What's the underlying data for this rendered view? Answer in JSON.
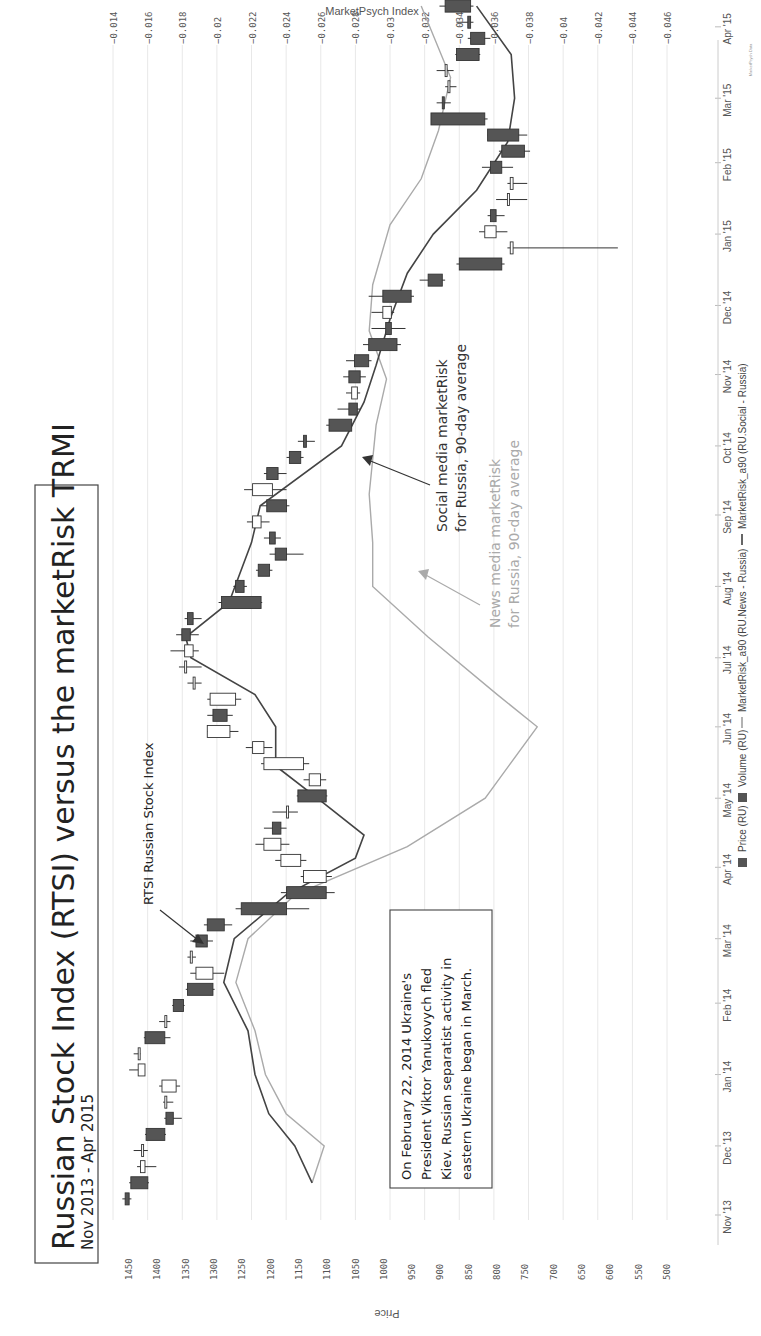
{
  "title": "Russian Stock Index (RTSI) versus the marketRisk TRMI",
  "subtitle": "Nov 2013 - Apr 2015",
  "right_axis_title": "MarketPsych Index",
  "left_axis_title": "Price",
  "watermark": "MarketPsych Data",
  "annotations": {
    "rtsi_label": "RTSI Russian Stock Index",
    "social_label_1": "Social media marketRisk",
    "social_label_2": "for Russia, 90-day average",
    "news_label_1": "News media marketRisk",
    "news_label_2": "for Russia, 90-day average",
    "event_box": [
      "On February 22, 2014 Ukraine's",
      "President Viktor Yanukovych fled",
      "Kiev.  Russian separatist activity in",
      "eastern Ukraine began in March."
    ]
  },
  "legend": {
    "price": "Price (RU)",
    "volume": "Volume (RU)",
    "news": "MarketRisk_a90 (RU.News - Russia)",
    "social": "MarketRisk_a90 (RU.Social - Russia)"
  },
  "colors": {
    "candle_down": "#555555",
    "candle_up": "#ffffff",
    "social_line": "#444444",
    "news_line": "#aaaaaa",
    "grid": "#e6e6e6"
  },
  "chart_data": {
    "type": "candlestick+line",
    "title": "Russian Stock Index (RTSI) versus the marketRisk TRMI",
    "subtitle": "Nov 2013 - Apr 2015",
    "orientation": "rotated 90° (time runs bottom-to-top, price axis along bottom)",
    "xlabel": "Date",
    "ylabel_left": "Price",
    "ylabel_right": "MarketPsych Index",
    "price_ticks": [
      1450,
      1400,
      1350,
      1300,
      1250,
      1200,
      1150,
      1100,
      1050,
      1000,
      950,
      900,
      850,
      800,
      750,
      700,
      650,
      600,
      550,
      500
    ],
    "price_range": [
      500,
      1450
    ],
    "index_ticks": [
      "-0.014",
      "-0.016",
      "-0.018",
      "-0.02",
      "-0.022",
      "-0.024",
      "-0.026",
      "-0.028",
      "-0.03",
      "-0.032",
      "-0.034",
      "-0.036",
      "-0.038",
      "-0.04",
      "-0.042",
      "-0.044",
      "-0.046"
    ],
    "index_range": [
      -0.046,
      -0.014
    ],
    "date_ticks": [
      "Nov '13",
      "Dec '13",
      "Jan '14",
      "Feb '14",
      "Mar '14",
      "Apr '14",
      "May '14",
      "Jun '14",
      "Jul '14",
      "Aug '14",
      "Sep '14",
      "Oct '14",
      "Nov '14",
      "Dec '14",
      "Jan '15",
      "Feb '15",
      "Mar '15",
      "Apr '15"
    ],
    "grid": true,
    "legend_position": "bottom",
    "series": [
      {
        "name": "Price (RU)",
        "type": "candlestick",
        "weekly_candles": [
          {
            "week": "2013-11-08",
            "o": 1455,
            "c": 1448,
            "h": 1460,
            "l": 1444
          },
          {
            "week": "2013-11-15",
            "o": 1445,
            "c": 1415,
            "h": 1448,
            "l": 1413
          },
          {
            "week": "2013-11-22",
            "o": 1420,
            "c": 1428,
            "h": 1434,
            "l": 1400
          },
          {
            "week": "2013-11-29",
            "o": 1426,
            "c": 1426,
            "h": 1440,
            "l": 1415
          },
          {
            "week": "2013-12-06",
            "o": 1418,
            "c": 1385,
            "h": 1420,
            "l": 1383
          },
          {
            "week": "2013-12-13",
            "o": 1383,
            "c": 1370,
            "h": 1386,
            "l": 1355
          },
          {
            "week": "2013-12-20",
            "o": 1385,
            "c": 1385,
            "h": 1388,
            "l": 1370
          },
          {
            "week": "2013-12-27",
            "o": 1365,
            "c": 1390,
            "h": 1395,
            "l": 1358
          },
          {
            "week": "2014-01-03",
            "o": 1420,
            "c": 1432,
            "h": 1448,
            "l": 1420
          },
          {
            "week": "2014-01-10",
            "o": 1432,
            "c": 1432,
            "h": 1440,
            "l": 1428
          },
          {
            "week": "2014-01-17",
            "o": 1420,
            "c": 1385,
            "h": 1422,
            "l": 1375
          },
          {
            "week": "2014-01-24",
            "o": 1385,
            "c": 1385,
            "h": 1395,
            "l": 1375
          },
          {
            "week": "2014-01-31",
            "o": 1370,
            "c": 1352,
            "h": 1372,
            "l": 1350
          },
          {
            "week": "2014-02-07",
            "o": 1345,
            "c": 1300,
            "h": 1348,
            "l": 1297
          },
          {
            "week": "2014-02-14",
            "o": 1300,
            "c": 1330,
            "h": 1340,
            "l": 1280
          },
          {
            "week": "2014-02-21",
            "o": 1340,
            "c": 1340,
            "h": 1345,
            "l": 1330
          },
          {
            "week": "2014-02-28",
            "o": 1330,
            "c": 1310,
            "h": 1340,
            "l": 1300
          },
          {
            "week": "2014-03-07",
            "o": 1310,
            "c": 1280,
            "h": 1316,
            "l": 1266
          },
          {
            "week": "2014-03-14",
            "o": 1250,
            "c": 1170,
            "h": 1260,
            "l": 1130
          },
          {
            "week": "2014-03-21",
            "o": 1170,
            "c": 1100,
            "h": 1180,
            "l": 1085
          },
          {
            "week": "2014-03-28",
            "o": 1100,
            "c": 1140,
            "h": 1145,
            "l": 1090
          },
          {
            "week": "2014-04-04",
            "o": 1145,
            "c": 1180,
            "h": 1190,
            "l": 1135
          },
          {
            "week": "2014-04-11",
            "o": 1180,
            "c": 1210,
            "h": 1225,
            "l": 1165
          },
          {
            "week": "2014-04-18",
            "o": 1195,
            "c": 1180,
            "h": 1210,
            "l": 1170
          },
          {
            "week": "2014-04-25",
            "o": 1170,
            "c": 1170,
            "h": 1195,
            "l": 1150
          },
          {
            "week": "2014-05-02",
            "o": 1150,
            "c": 1100,
            "h": 1152,
            "l": 1098
          },
          {
            "week": "2014-05-09",
            "o": 1110,
            "c": 1130,
            "h": 1140,
            "l": 1100
          },
          {
            "week": "2014-05-16",
            "o": 1140,
            "c": 1210,
            "h": 1215,
            "l": 1130
          },
          {
            "week": "2014-05-23",
            "o": 1210,
            "c": 1230,
            "h": 1242,
            "l": 1195
          },
          {
            "week": "2014-05-30",
            "o": 1270,
            "c": 1310,
            "h": 1310,
            "l": 1255
          },
          {
            "week": "2014-06-06",
            "o": 1300,
            "c": 1275,
            "h": 1310,
            "l": 1265
          },
          {
            "week": "2014-06-13",
            "o": 1260,
            "c": 1305,
            "h": 1310,
            "l": 1250
          },
          {
            "week": "2014-06-20",
            "o": 1335,
            "c": 1335,
            "h": 1345,
            "l": 1320
          },
          {
            "week": "2014-06-27",
            "o": 1350,
            "c": 1350,
            "h": 1360,
            "l": 1320
          },
          {
            "week": "2014-07-04",
            "o": 1335,
            "c": 1350,
            "h": 1375,
            "l": 1325
          },
          {
            "week": "2014-07-11",
            "o": 1355,
            "c": 1340,
            "h": 1365,
            "l": 1325
          },
          {
            "week": "2014-07-18",
            "o": 1345,
            "c": 1335,
            "h": 1350,
            "l": 1320
          },
          {
            "week": "2014-07-25",
            "o": 1285,
            "c": 1215,
            "h": 1290,
            "l": 1213
          },
          {
            "week": "2014-08-01",
            "o": 1260,
            "c": 1245,
            "h": 1264,
            "l": 1240
          },
          {
            "week": "2014-08-08",
            "o": 1220,
            "c": 1200,
            "h": 1224,
            "l": 1195
          },
          {
            "week": "2014-08-15",
            "o": 1190,
            "c": 1170,
            "h": 1200,
            "l": 1140
          },
          {
            "week": "2014-08-22",
            "o": 1200,
            "c": 1190,
            "h": 1210,
            "l": 1180
          },
          {
            "week": "2014-08-29",
            "o": 1215,
            "c": 1230,
            "h": 1240,
            "l": 1200
          },
          {
            "week": "2014-09-05",
            "o": 1205,
            "c": 1170,
            "h": 1215,
            "l": 1165
          },
          {
            "week": "2014-09-12",
            "o": 1195,
            "c": 1230,
            "h": 1245,
            "l": 1170
          },
          {
            "week": "2014-09-19",
            "o": 1205,
            "c": 1185,
            "h": 1210,
            "l": 1170
          },
          {
            "week": "2014-09-26",
            "o": 1165,
            "c": 1145,
            "h": 1170,
            "l": 1140
          },
          {
            "week": "2014-10-03",
            "o": 1140,
            "c": 1135,
            "h": 1150,
            "l": 1120
          },
          {
            "week": "2014-10-10",
            "o": 1095,
            "c": 1055,
            "h": 1100,
            "l": 1054
          },
          {
            "week": "2014-10-17",
            "o": 1060,
            "c": 1045,
            "h": 1080,
            "l": 1040
          },
          {
            "week": "2014-10-24",
            "o": 1045,
            "c": 1055,
            "h": 1065,
            "l": 1040
          },
          {
            "week": "2014-10-31",
            "o": 1060,
            "c": 1040,
            "h": 1070,
            "l": 1030
          },
          {
            "week": "2014-11-07",
            "o": 1050,
            "c": 1025,
            "h": 1065,
            "l": 1020
          },
          {
            "week": "2014-11-14",
            "o": 1025,
            "c": 975,
            "h": 1035,
            "l": 968
          },
          {
            "week": "2014-11-21",
            "o": 995,
            "c": 985,
            "h": 1020,
            "l": 960
          },
          {
            "week": "2014-11-28",
            "o": 985,
            "c": 1000,
            "h": 1020,
            "l": 980
          },
          {
            "week": "2014-12-05",
            "o": 1000,
            "c": 950,
            "h": 1025,
            "l": 945
          },
          {
            "week": "2014-12-12",
            "o": 920,
            "c": 895,
            "h": 935,
            "l": 890
          },
          {
            "week": "2014-12-19",
            "o": 865,
            "c": 790,
            "h": 870,
            "l": 785
          },
          {
            "week": "2014-12-26",
            "o": 770,
            "c": 775,
            "h": 780,
            "l": 585
          },
          {
            "week": "2015-01-02",
            "o": 800,
            "c": 820,
            "h": 830,
            "l": 780
          },
          {
            "week": "2015-01-09",
            "o": 810,
            "c": 800,
            "h": 815,
            "l": 785
          },
          {
            "week": "2015-01-16",
            "o": 780,
            "c": 780,
            "h": 800,
            "l": 745
          },
          {
            "week": "2015-01-23",
            "o": 770,
            "c": 775,
            "h": 780,
            "l": 745
          },
          {
            "week": "2015-01-30",
            "o": 810,
            "c": 790,
            "h": 825,
            "l": 770
          },
          {
            "week": "2015-02-06",
            "o": 790,
            "c": 750,
            "h": 795,
            "l": 740
          },
          {
            "week": "2015-02-13",
            "o": 815,
            "c": 760,
            "h": 815,
            "l": 745
          },
          {
            "week": "2015-02-20",
            "o": 915,
            "c": 820,
            "h": 915,
            "l": 815
          },
          {
            "week": "2015-02-27",
            "o": 895,
            "c": 892,
            "h": 905,
            "l": 880
          },
          {
            "week": "2015-03-06",
            "o": 885,
            "c": 885,
            "h": 890,
            "l": 870
          },
          {
            "week": "2015-03-13",
            "o": 890,
            "c": 890,
            "h": 905,
            "l": 875
          },
          {
            "week": "2015-03-20",
            "o": 870,
            "c": 830,
            "h": 872,
            "l": 828
          },
          {
            "week": "2015-03-27",
            "o": 845,
            "c": 820,
            "h": 850,
            "l": 810
          },
          {
            "week": "2015-04-03",
            "o": 850,
            "c": 845,
            "h": 870,
            "l": 840
          },
          {
            "week": "2015-04-10",
            "o": 890,
            "c": 845,
            "h": 900,
            "l": 840
          }
        ]
      },
      {
        "name": "MarketRisk_a90 (RU.Social - Russia)",
        "type": "line",
        "points_date_index": [
          [
            "2013-11-15",
            -0.0255
          ],
          [
            "2013-12-01",
            -0.0245
          ],
          [
            "2013-12-15",
            -0.023
          ],
          [
            "2014-01-01",
            -0.0222
          ],
          [
            "2014-01-20",
            -0.0218
          ],
          [
            "2014-02-10",
            -0.0204
          ],
          [
            "2014-03-01",
            -0.021
          ],
          [
            "2014-03-20",
            -0.024
          ],
          [
            "2014-04-05",
            -0.028
          ],
          [
            "2014-04-15",
            -0.0285
          ],
          [
            "2014-05-01",
            -0.0258
          ],
          [
            "2014-05-15",
            -0.0234
          ],
          [
            "2014-06-01",
            -0.0234
          ],
          [
            "2014-06-15",
            -0.0222
          ],
          [
            "2014-07-01",
            -0.0185
          ],
          [
            "2014-07-10",
            -0.0182
          ],
          [
            "2014-07-25",
            -0.0207
          ],
          [
            "2014-08-20",
            -0.022
          ],
          [
            "2014-09-05",
            -0.0225
          ],
          [
            "2014-10-01",
            -0.0272
          ],
          [
            "2014-10-20",
            -0.0285
          ],
          [
            "2014-11-05",
            -0.0292
          ],
          [
            "2014-11-25",
            -0.03
          ],
          [
            "2014-12-15",
            -0.031
          ],
          [
            "2015-01-01",
            -0.0325
          ],
          [
            "2015-01-20",
            -0.035
          ],
          [
            "2015-02-10",
            -0.0368
          ],
          [
            "2015-03-01",
            -0.0372
          ],
          [
            "2015-03-20",
            -0.037
          ],
          [
            "2015-04-10",
            -0.035
          ]
        ]
      },
      {
        "name": "MarketRisk_a90 (RU.News - Russia)",
        "type": "line",
        "points_date_index": [
          [
            "2013-11-15",
            -0.0255
          ],
          [
            "2013-12-01",
            -0.0262
          ],
          [
            "2013-12-15",
            -0.024
          ],
          [
            "2014-01-01",
            -0.0228
          ],
          [
            "2014-01-20",
            -0.0222
          ],
          [
            "2014-02-10",
            -0.0211
          ],
          [
            "2014-03-01",
            -0.0218
          ],
          [
            "2014-03-20",
            -0.0245
          ],
          [
            "2014-04-10",
            -0.031
          ],
          [
            "2014-05-01",
            -0.0355
          ],
          [
            "2014-06-01",
            -0.0385
          ],
          [
            "2014-06-15",
            -0.0362
          ],
          [
            "2014-07-10",
            -0.0322
          ],
          [
            "2014-08-01",
            -0.029
          ],
          [
            "2014-08-20",
            -0.029
          ],
          [
            "2014-09-10",
            -0.0288
          ],
          [
            "2014-10-10",
            -0.0292
          ],
          [
            "2014-10-30",
            -0.0298
          ],
          [
            "2014-11-20",
            -0.0288
          ],
          [
            "2014-12-10",
            -0.029
          ],
          [
            "2015-01-05",
            -0.03
          ],
          [
            "2015-01-25",
            -0.0318
          ],
          [
            "2015-02-15",
            -0.0328
          ],
          [
            "2015-03-10",
            -0.0335
          ],
          [
            "2015-04-10",
            -0.0318
          ]
        ]
      }
    ],
    "annotations": [
      "RTSI Russian Stock Index",
      "Social media marketRisk for Russia, 90-day average",
      "News media marketRisk for Russia, 90-day average",
      "On February 22, 2014 Ukraine's President Viktor Yanukovych fled Kiev. Russian separatist activity in eastern Ukraine began in March."
    ]
  }
}
